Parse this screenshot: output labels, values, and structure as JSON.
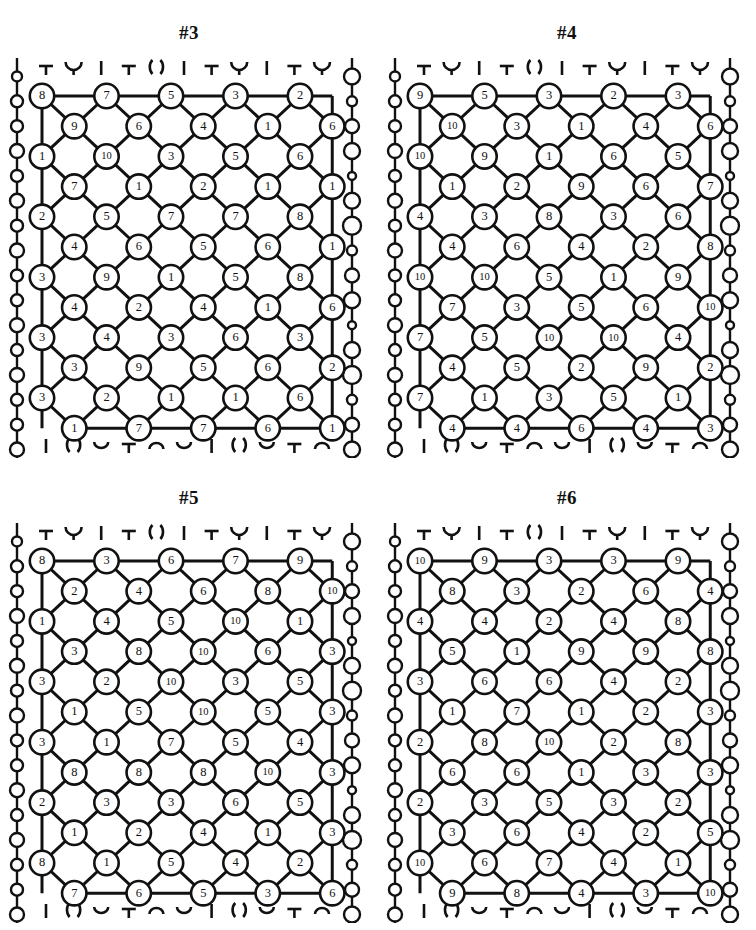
{
  "page": {
    "background": "#ffffff",
    "ink": "#111111",
    "width": 756,
    "height": 930
  },
  "panels": [
    {
      "id": "panel-3",
      "title": "#3",
      "position": {
        "col": 0,
        "row": 0
      },
      "rows": [
        {
          "type": "main",
          "values": [
            8,
            7,
            5,
            3,
            2
          ]
        },
        {
          "type": "offset",
          "values": [
            9,
            6,
            4,
            1,
            6
          ]
        },
        {
          "type": "main",
          "values": [
            1,
            10,
            3,
            5,
            6
          ]
        },
        {
          "type": "offset",
          "values": [
            7,
            1,
            2,
            1,
            1
          ]
        },
        {
          "type": "main",
          "values": [
            2,
            5,
            7,
            7,
            8
          ]
        },
        {
          "type": "offset",
          "values": [
            4,
            6,
            5,
            6,
            1
          ]
        },
        {
          "type": "main",
          "values": [
            3,
            9,
            1,
            5,
            8
          ]
        },
        {
          "type": "offset",
          "values": [
            4,
            2,
            4,
            1,
            6
          ]
        },
        {
          "type": "main",
          "values": [
            3,
            4,
            3,
            6,
            3
          ]
        },
        {
          "type": "offset",
          "values": [
            3,
            9,
            5,
            6,
            2
          ]
        },
        {
          "type": "main",
          "values": [
            3,
            2,
            1,
            1,
            6
          ]
        },
        {
          "type": "offset",
          "values": [
            1,
            7,
            7,
            6,
            1
          ]
        }
      ]
    },
    {
      "id": "panel-4",
      "title": "#4",
      "position": {
        "col": 1,
        "row": 0
      },
      "rows": [
        {
          "type": "main",
          "values": [
            9,
            5,
            3,
            2,
            3
          ]
        },
        {
          "type": "offset",
          "values": [
            10,
            3,
            1,
            4,
            6
          ]
        },
        {
          "type": "main",
          "values": [
            10,
            9,
            1,
            6,
            5
          ]
        },
        {
          "type": "offset",
          "values": [
            1,
            2,
            9,
            6,
            7
          ]
        },
        {
          "type": "main",
          "values": [
            4,
            3,
            8,
            3,
            6
          ]
        },
        {
          "type": "offset",
          "values": [
            4,
            6,
            4,
            2,
            8
          ]
        },
        {
          "type": "main",
          "values": [
            10,
            10,
            5,
            1,
            9
          ]
        },
        {
          "type": "offset",
          "values": [
            7,
            3,
            5,
            6,
            10
          ]
        },
        {
          "type": "main",
          "values": [
            7,
            5,
            10,
            10,
            4
          ]
        },
        {
          "type": "offset",
          "values": [
            4,
            5,
            2,
            9,
            2
          ]
        },
        {
          "type": "main",
          "values": [
            7,
            1,
            3,
            5,
            1
          ]
        },
        {
          "type": "offset",
          "values": [
            4,
            4,
            6,
            4,
            3
          ]
        }
      ]
    },
    {
      "id": "panel-5",
      "title": "#5",
      "position": {
        "col": 0,
        "row": 1
      },
      "rows": [
        {
          "type": "main",
          "values": [
            8,
            3,
            6,
            7,
            9
          ]
        },
        {
          "type": "offset",
          "values": [
            2,
            4,
            6,
            8,
            10
          ]
        },
        {
          "type": "main",
          "values": [
            1,
            4,
            5,
            10,
            1
          ]
        },
        {
          "type": "offset",
          "values": [
            3,
            8,
            10,
            6,
            3
          ]
        },
        {
          "type": "main",
          "values": [
            3,
            2,
            10,
            3,
            5
          ]
        },
        {
          "type": "offset",
          "values": [
            1,
            5,
            10,
            5,
            3
          ]
        },
        {
          "type": "main",
          "values": [
            3,
            1,
            7,
            5,
            4
          ]
        },
        {
          "type": "offset",
          "values": [
            8,
            8,
            8,
            10,
            3
          ]
        },
        {
          "type": "main",
          "values": [
            2,
            3,
            3,
            6,
            5
          ]
        },
        {
          "type": "offset",
          "values": [
            1,
            2,
            4,
            1,
            3
          ]
        },
        {
          "type": "main",
          "values": [
            8,
            1,
            5,
            4,
            2
          ]
        },
        {
          "type": "offset",
          "values": [
            7,
            6,
            5,
            3,
            6
          ]
        }
      ]
    },
    {
      "id": "panel-6",
      "title": "#6",
      "position": {
        "col": 1,
        "row": 1
      },
      "rows": [
        {
          "type": "main",
          "values": [
            10,
            9,
            3,
            3,
            9
          ]
        },
        {
          "type": "offset",
          "values": [
            8,
            3,
            2,
            6,
            4
          ]
        },
        {
          "type": "main",
          "values": [
            4,
            4,
            2,
            4,
            8
          ]
        },
        {
          "type": "offset",
          "values": [
            5,
            1,
            9,
            9,
            8
          ]
        },
        {
          "type": "main",
          "values": [
            3,
            6,
            6,
            4,
            2
          ]
        },
        {
          "type": "offset",
          "values": [
            1,
            7,
            1,
            2,
            3
          ]
        },
        {
          "type": "main",
          "values": [
            2,
            8,
            10,
            2,
            8
          ]
        },
        {
          "type": "offset",
          "values": [
            6,
            6,
            1,
            3,
            3
          ]
        },
        {
          "type": "main",
          "values": [
            2,
            3,
            5,
            3,
            2
          ]
        },
        {
          "type": "offset",
          "values": [
            3,
            6,
            4,
            2,
            5
          ]
        },
        {
          "type": "main",
          "values": [
            10,
            6,
            7,
            4,
            1
          ]
        },
        {
          "type": "offset",
          "values": [
            9,
            8,
            4,
            3,
            10
          ]
        }
      ]
    }
  ],
  "chain": {
    "bead_radii_left": [
      5,
      6,
      6,
      7,
      6,
      7,
      6,
      7,
      6,
      6,
      7,
      6,
      7,
      6,
      6,
      7
    ],
    "bead_radii_right": [
      8,
      5,
      7,
      8,
      4,
      8,
      9,
      5,
      7,
      8,
      4,
      8,
      9,
      5,
      7,
      8
    ],
    "stroke": "#111111"
  },
  "edge_glyphs": {
    "top": [
      "T",
      "U",
      "I",
      "T",
      "()",
      "I",
      "T",
      "U",
      "I",
      "T",
      "U"
    ],
    "bottom": [
      "I",
      "()",
      "V",
      "T",
      "A",
      "V",
      "I",
      "()",
      "V",
      "T",
      "A"
    ]
  }
}
